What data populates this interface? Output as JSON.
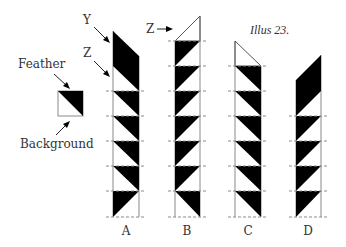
{
  "title": "Illus 23.",
  "legend": {
    "feather_label": "Feather",
    "background_label": "Background"
  },
  "annotations": {
    "y_label": "Y",
    "z_label_a": "Z",
    "z_label_b": "Z"
  },
  "columns": [
    {
      "label": "A",
      "top": "black parallelogram (Y) with white triangle (Z) below",
      "cells": "black upper-right triangles; last cell black lower-left"
    },
    {
      "label": "B",
      "top": "outline triangle (Z)",
      "cells": "black upper-left triangles; last cell black upper-right"
    },
    {
      "label": "C",
      "top": "outline triangle",
      "cells": "black upper-right triangles"
    },
    {
      "label": "D",
      "top": "black parallelogram",
      "cells": "black upper-left triangles"
    }
  ],
  "colors": {
    "feather": "#000000",
    "background": "#ffffff",
    "grid": "#8a8a8a",
    "text": "#333333"
  }
}
